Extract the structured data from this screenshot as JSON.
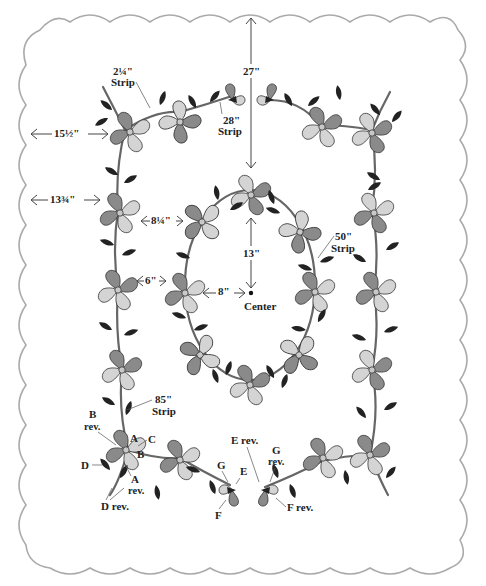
{
  "diagram": {
    "colors": {
      "border_scallop": "#aaaaaa",
      "petal_dark": "#8a8a8a",
      "petal_light": "#d4d4d4",
      "leaf": "#222222",
      "vine": "#666666"
    },
    "measurements": {
      "top_to_oval": "27\"",
      "left_to_outer_vine_top": "15½\"",
      "left_to_outer_vine_mid": "13¾\"",
      "outer_to_oval_upper": "8¼\"",
      "outer_to_oval_mid": "6\"",
      "oval_to_center_horizontal": "8\"",
      "oval_to_center_vertical": "13\""
    },
    "strips": {
      "strip_2_25": {
        "size": "2¼\"",
        "label": "Strip"
      },
      "strip_28": {
        "size": "28\"",
        "label": "Strip"
      },
      "strip_50": {
        "size": "50\"",
        "label": "Strip"
      },
      "strip_85": {
        "size": "85\"",
        "label": "Strip"
      }
    },
    "center_label": "Center",
    "pattern_pieces": {
      "A": "A",
      "A_rev": {
        "letter": "A",
        "suffix": "rev."
      },
      "B": "B",
      "B_rev": {
        "letter": "B",
        "suffix": "rev."
      },
      "C": "C",
      "D": "D",
      "D_rev": "D rev.",
      "E": "E",
      "E_rev": "E rev.",
      "F": "F",
      "F_rev": "F rev.",
      "G": "G",
      "G_rev": {
        "letter": "G",
        "suffix": "rev."
      }
    }
  }
}
